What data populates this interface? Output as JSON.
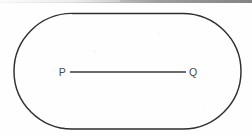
{
  "figure": {
    "background_color": "#fefefe",
    "stroke_color": "#2e2e33",
    "label_color": "#4a4a50",
    "width": 252,
    "height": 136
  },
  "shape": {
    "name": "stadium",
    "description": "rounded rectangle / oblong outline",
    "left": 14,
    "top": 13,
    "right": 241,
    "bottom": 129,
    "corner_radius": 58
  },
  "segment": {
    "name": "PQ",
    "x1": 70,
    "x2": 186,
    "y": 72,
    "endpoints": [
      {
        "id": "P",
        "label": "P",
        "x": 70,
        "y": 72
      },
      {
        "id": "Q",
        "label": "Q",
        "x": 186,
        "y": 72
      }
    ]
  },
  "labels": {
    "p": "P",
    "q": "Q"
  }
}
